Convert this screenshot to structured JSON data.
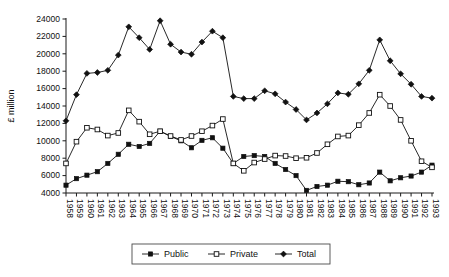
{
  "chart_data": {
    "type": "line",
    "title": "",
    "xlabel": "",
    "ylabel": "£ million",
    "ylim": [
      4000,
      24000
    ],
    "ytick_step": 2000,
    "yticks": [
      4000,
      6000,
      8000,
      10000,
      12000,
      14000,
      16000,
      18000,
      20000,
      22000,
      24000
    ],
    "grid": false,
    "legend_position": "bottom",
    "categories": [
      "1958",
      "1959",
      "1960",
      "1961",
      "1962",
      "1963",
      "1964",
      "1965",
      "1966",
      "1967",
      "1968",
      "1969",
      "1970",
      "1971",
      "1972",
      "1973",
      "1974",
      "1975",
      "1976",
      "1977",
      "1978",
      "1979",
      "1980",
      "1981",
      "1982",
      "1983",
      "1984",
      "1985",
      "1986",
      "1987",
      "1988",
      "1989",
      "1990",
      "1991",
      "1992",
      "1993"
    ],
    "series": [
      {
        "name": "Public",
        "marker": "filled-square",
        "values": [
          4900,
          5650,
          6050,
          6450,
          7400,
          8450,
          9600,
          9350,
          9700,
          11100,
          10500,
          10000,
          9200,
          10050,
          10350,
          9150,
          7400,
          8200,
          8300,
          8200,
          7400,
          6700,
          6000,
          4300,
          4750,
          4900,
          5350,
          5300,
          4950,
          5150,
          6400,
          5400,
          5750,
          5950,
          6400,
          7200
        ]
      },
      {
        "name": "Private",
        "marker": "open-square",
        "values": [
          7400,
          9900,
          11500,
          11300,
          10600,
          10900,
          13500,
          12200,
          10750,
          11100,
          10550,
          10100,
          10550,
          11100,
          11750,
          12500,
          7400,
          6550,
          7500,
          7900,
          8300,
          8250,
          8000,
          8050,
          8600,
          9600,
          10500,
          10600,
          11800,
          13200,
          15300,
          14000,
          12400,
          10000,
          7650,
          6950
        ]
      },
      {
        "name": "Total",
        "marker": "filled-diamond",
        "values": [
          12300,
          15300,
          17750,
          17850,
          18100,
          19850,
          23100,
          21850,
          20500,
          23800,
          21100,
          20200,
          19950,
          21350,
          22600,
          21850,
          15100,
          14850,
          14850,
          15750,
          15400,
          14450,
          13600,
          12400,
          13200,
          14250,
          15500,
          15350,
          16550,
          18100,
          21600,
          19200,
          17700,
          16500,
          15100,
          14900
        ]
      }
    ],
    "legend": [
      {
        "label": "Public",
        "marker": "filled-square"
      },
      {
        "label": "Private",
        "marker": "open-square"
      },
      {
        "label": "Total",
        "marker": "filled-diamond"
      }
    ],
    "colors": {
      "line": "#111111",
      "marker_fill": "#111111",
      "marker_open_fill": "#ffffff",
      "axis": "#1a1a1a",
      "background": "#ffffff"
    }
  }
}
